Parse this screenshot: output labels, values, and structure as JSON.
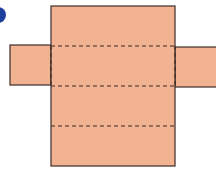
{
  "diagram": {
    "type": "net-of-rectangular-prism",
    "colors": {
      "fill": "#f2b392",
      "stroke": "#3d2b26",
      "fold_line": "#3d2b26",
      "marker": "#1f3f9e"
    },
    "faces": [
      {
        "name": "top-face",
        "x": 51,
        "y": 6,
        "w": 124,
        "h": 40
      },
      {
        "name": "front-face",
        "x": 51,
        "y": 46,
        "w": 124,
        "h": 40
      },
      {
        "name": "bottom-face",
        "x": 51,
        "y": 86,
        "w": 124,
        "h": 40
      },
      {
        "name": "back-face",
        "x": 51,
        "y": 126,
        "w": 124,
        "h": 40
      },
      {
        "name": "left-side-flap",
        "x": 10,
        "y": 45,
        "w": 41,
        "h": 40
      },
      {
        "name": "right-side-flap",
        "x": 175,
        "y": 47,
        "w": 41,
        "h": 40
      }
    ],
    "fold_lines": [
      {
        "x1": 51,
        "y1": 46,
        "x2": 175,
        "y2": 46
      },
      {
        "x1": 51,
        "y1": 86,
        "x2": 175,
        "y2": 86
      },
      {
        "x1": 51,
        "y1": 126,
        "x2": 175,
        "y2": 126
      },
      {
        "x1": 51,
        "y1": 46,
        "x2": 51,
        "y2": 86
      },
      {
        "x1": 175,
        "y1": 46,
        "x2": 175,
        "y2": 86
      }
    ]
  }
}
